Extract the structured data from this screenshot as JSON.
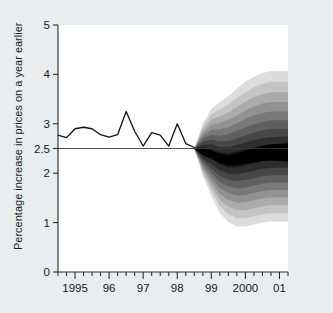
{
  "chart_data": {
    "type": "area",
    "title": "",
    "subtitle": "",
    "xlabel": "",
    "ylabel": "Percentage increase in prices on a year earlier",
    "xlim": [
      1994.5,
      2001.25
    ],
    "ylim": [
      0,
      5
    ],
    "grid": false,
    "legend_position": "none",
    "y_ticks": [
      {
        "value": 0,
        "label": "0"
      },
      {
        "value": 1,
        "label": "1"
      },
      {
        "value": 2,
        "label": "2"
      },
      {
        "value": 2.5,
        "label": "2.5"
      },
      {
        "value": 3,
        "label": "3"
      },
      {
        "value": 4,
        "label": "4"
      },
      {
        "value": 5,
        "label": "5"
      }
    ],
    "x_ticks_major": [
      {
        "value": 1995,
        "label": "1995"
      },
      {
        "value": 1996,
        "label": "96"
      },
      {
        "value": 1997,
        "label": "97"
      },
      {
        "value": 1998,
        "label": "98"
      },
      {
        "value": 1999,
        "label": "99"
      },
      {
        "value": 2000,
        "label": "2000"
      },
      {
        "value": 2001,
        "label": "01"
      }
    ],
    "x_ticks_minor_step": 0.25,
    "target_line": {
      "value": 2.5,
      "label": "2.5% inflation target"
    },
    "history_series": {
      "name": "RPIX inflation outturn",
      "x": [
        1994.5,
        1994.75,
        1995.0,
        1995.25,
        1995.5,
        1995.75,
        1996.0,
        1996.25,
        1996.5,
        1996.75,
        1997.0,
        1997.25,
        1997.5,
        1997.75,
        1998.0,
        1998.25,
        1998.5
      ],
      "values": [
        2.77,
        2.72,
        2.9,
        2.93,
        2.9,
        2.78,
        2.73,
        2.78,
        3.25,
        2.85,
        2.55,
        2.82,
        2.77,
        2.55,
        3.0,
        2.6,
        2.52
      ]
    },
    "forecast_fan": {
      "name": "Inflation projection probability distribution",
      "start_x": 1998.5,
      "end_x": 2001.25,
      "central_label": "central projection",
      "x": [
        1998.5,
        1998.75,
        1999.0,
        1999.25,
        1999.5,
        1999.75,
        2000.0,
        2000.25,
        2000.5,
        2000.75,
        2001.0,
        2001.25
      ],
      "central": [
        2.5,
        2.44,
        2.38,
        2.3,
        2.26,
        2.28,
        2.32,
        2.36,
        2.4,
        2.42,
        2.42,
        2.42
      ],
      "bands": [
        {
          "probability": 10,
          "shade": "#151515",
          "upper": [
            2.5,
            2.52,
            2.48,
            2.42,
            2.4,
            2.44,
            2.48,
            2.52,
            2.56,
            2.58,
            2.58,
            2.58
          ],
          "lower": [
            2.5,
            2.36,
            2.28,
            2.18,
            2.12,
            2.12,
            2.16,
            2.2,
            2.24,
            2.26,
            2.26,
            2.26
          ]
        },
        {
          "probability": 20,
          "shade": "#2e2e2e",
          "upper": [
            2.5,
            2.58,
            2.58,
            2.53,
            2.52,
            2.57,
            2.62,
            2.67,
            2.71,
            2.73,
            2.74,
            2.74
          ],
          "lower": [
            2.5,
            2.3,
            2.18,
            2.06,
            1.99,
            1.98,
            2.01,
            2.05,
            2.09,
            2.11,
            2.11,
            2.11
          ]
        },
        {
          "probability": 30,
          "shade": "#474747",
          "upper": [
            2.5,
            2.64,
            2.68,
            2.64,
            2.65,
            2.71,
            2.77,
            2.82,
            2.87,
            2.9,
            2.9,
            2.9
          ],
          "lower": [
            2.5,
            2.25,
            2.09,
            1.94,
            1.86,
            1.84,
            1.86,
            1.9,
            1.94,
            1.96,
            1.96,
            1.96
          ]
        },
        {
          "probability": 40,
          "shade": "#606060",
          "upper": [
            2.5,
            2.7,
            2.78,
            2.76,
            2.79,
            2.86,
            2.93,
            2.99,
            3.04,
            3.07,
            3.07,
            3.07
          ],
          "lower": [
            2.5,
            2.2,
            2.0,
            1.82,
            1.73,
            1.69,
            1.71,
            1.75,
            1.79,
            1.81,
            1.81,
            1.81
          ]
        },
        {
          "probability": 50,
          "shade": "#797979",
          "upper": [
            2.5,
            2.76,
            2.88,
            2.89,
            2.93,
            3.01,
            3.1,
            3.17,
            3.22,
            3.25,
            3.25,
            3.25
          ],
          "lower": [
            2.5,
            2.15,
            1.91,
            1.7,
            1.6,
            1.55,
            1.56,
            1.6,
            1.64,
            1.66,
            1.66,
            1.66
          ]
        },
        {
          "probability": 60,
          "shade": "#929292",
          "upper": [
            2.5,
            2.82,
            2.98,
            3.02,
            3.08,
            3.17,
            3.27,
            3.35,
            3.41,
            3.44,
            3.44,
            3.44
          ],
          "lower": [
            2.5,
            2.1,
            1.82,
            1.58,
            1.46,
            1.4,
            1.41,
            1.45,
            1.49,
            1.51,
            1.51,
            1.51
          ]
        },
        {
          "probability": 70,
          "shade": "#ababab",
          "upper": [
            2.5,
            2.88,
            3.08,
            3.15,
            3.23,
            3.34,
            3.45,
            3.54,
            3.6,
            3.64,
            3.64,
            3.64
          ],
          "lower": [
            2.5,
            2.05,
            1.73,
            1.46,
            1.32,
            1.25,
            1.25,
            1.29,
            1.33,
            1.35,
            1.35,
            1.35
          ]
        },
        {
          "probability": 80,
          "shade": "#c4c4c4",
          "upper": [
            2.5,
            2.94,
            3.19,
            3.29,
            3.39,
            3.52,
            3.64,
            3.74,
            3.81,
            3.85,
            3.85,
            3.85
          ],
          "lower": [
            2.5,
            2.0,
            1.64,
            1.33,
            1.17,
            1.09,
            1.09,
            1.13,
            1.17,
            1.19,
            1.19,
            1.19
          ]
        },
        {
          "probability": 90,
          "shade": "#dcdcdc",
          "upper": [
            2.5,
            3.0,
            3.3,
            3.44,
            3.56,
            3.71,
            3.85,
            3.95,
            4.03,
            4.07,
            4.07,
            4.07
          ],
          "lower": [
            2.5,
            1.95,
            1.54,
            1.19,
            1.01,
            0.92,
            0.92,
            0.96,
            1.0,
            1.02,
            1.02,
            1.02
          ]
        }
      ]
    }
  },
  "axis": {
    "y_title": "Percentage increase in prices on a year earlier"
  }
}
